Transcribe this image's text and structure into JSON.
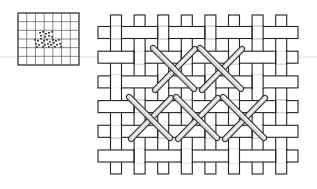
{
  "figure": {
    "title": "",
    "colors": {
      "background": "#ffffff",
      "outline": "#222222",
      "fabric": "#ffffff",
      "thread": "#d6d6d6",
      "guide_line": "#dcdcdc"
    }
  },
  "fabric": {
    "warp_threads": 8,
    "weft_threads": 6,
    "weave": "plain"
  },
  "stitches": {
    "type": "cross-stitch",
    "rows": [
      {
        "name": "upper-row",
        "count": 2,
        "start_column": 2
      },
      {
        "name": "lower-row",
        "count": 3,
        "start_column": 1
      }
    ]
  },
  "thumbnail": {
    "grid_columns": 7,
    "grid_rows": 6,
    "content": "miniature stitch pattern"
  }
}
